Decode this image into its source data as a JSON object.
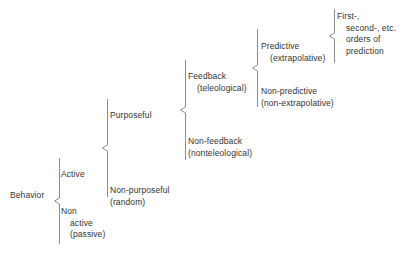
{
  "diagram": {
    "type": "brace-tree",
    "line_color": "#8c8c8c",
    "text_color": "#333333",
    "background": "#ffffff",
    "root": {
      "label": "Behavior"
    },
    "level1": {
      "active": "Active",
      "nonactive_line1": "Non",
      "nonactive_line2": "active",
      "nonactive_line3": "(passive)"
    },
    "level2": {
      "purposeful": "Purposeful",
      "nonpurposeful_line1": "Non-purposeful",
      "nonpurposeful_line2": "(random)"
    },
    "level3": {
      "feedback_line1": "Feedback",
      "feedback_line2": "(teleological)",
      "nonfeedback_line1": "Non-feedback",
      "nonfeedback_line2": "(nonteleological)"
    },
    "level4": {
      "predictive_line1": "Predictive",
      "predictive_line2": "(extrapolative)",
      "nonpredictive_line1": "Non-predictive",
      "nonpredictive_line2": "(non-extrapolative)"
    },
    "level5": {
      "orders_line1": "First-,",
      "orders_line2": "second-, etc.",
      "orders_line3": "orders of",
      "orders_line4": "prediction"
    }
  }
}
